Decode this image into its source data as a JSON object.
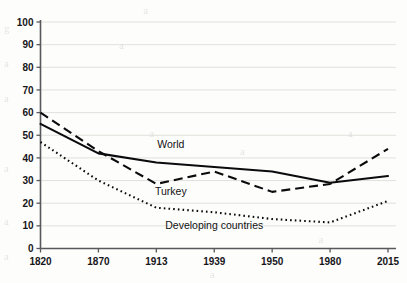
{
  "chart_data": {
    "type": "line",
    "title": "",
    "subtitle": "",
    "xlabel": "",
    "ylabel": "",
    "categories": [
      "1820",
      "1870",
      "1913",
      "1939",
      "1950",
      "1980",
      "2015"
    ],
    "x_tick_labels": [
      "1820",
      "1870",
      "1913",
      "1939",
      "1950",
      "1980",
      "2015"
    ],
    "y_tick_labels": [
      "0",
      "10",
      "20",
      "30",
      "40",
      "50",
      "60",
      "70",
      "80",
      "90",
      "100"
    ],
    "ylim": [
      0,
      100
    ],
    "y_tick_step": 10,
    "grid": "horizontal",
    "legend_position": "inline-annotations",
    "series": [
      {
        "name": "World",
        "style": "solid",
        "color": "#0b0b0e",
        "label": "World",
        "values": [
          55,
          42,
          38,
          36,
          34,
          29,
          32
        ]
      },
      {
        "name": "Turkey",
        "style": "dashed",
        "color": "#0b0b0e",
        "label": "Turkey",
        "values": [
          60,
          43,
          28.5,
          34,
          25,
          28.5,
          44
        ]
      },
      {
        "name": "Developing countries",
        "style": "dotted",
        "color": "#0b0b0e",
        "label": "Developing countries",
        "values": [
          47,
          30,
          18,
          16,
          13,
          11.5,
          21
        ]
      }
    ],
    "annotations": [
      {
        "text": "World",
        "x_frac": 0.375,
        "value": 44.5
      },
      {
        "text": "Turkey",
        "x_frac": 0.375,
        "value": 23.5
      },
      {
        "text": "Developing countries",
        "x_frac": 0.5,
        "value": 8.5
      }
    ]
  },
  "page": {
    "bleed_text": "                       a                                                            g\n                   a                                                             a\n                                                                               a\n\n                        a                                a\n                                       a                                  a\n\n                                                                           a\n                                                    a                        a\n                                  a\n                                                             a\n                           a                                      a\n                      a                                                    a\n                                             a                      a\n                                   a                  a\n                  a                                                    a\n                        a                                     a"
  }
}
